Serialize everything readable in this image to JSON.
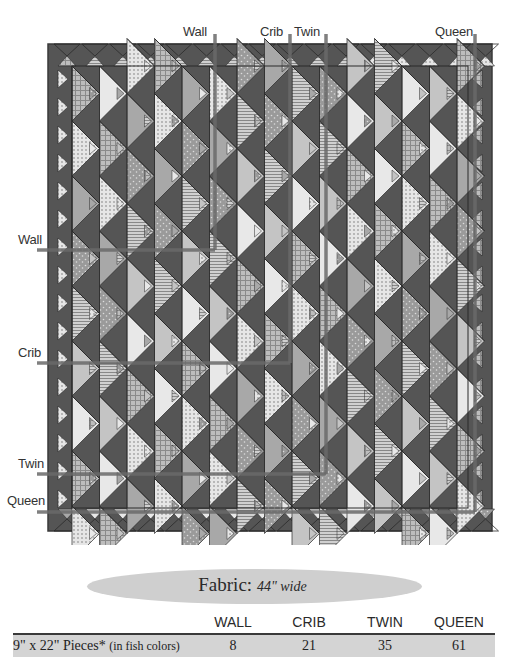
{
  "diagram": {
    "top_labels": [
      {
        "text": "Wall",
        "x": 215
      },
      {
        "text": "Crib",
        "x": 290
      },
      {
        "text": "Twin",
        "x": 326
      },
      {
        "text": "Queen",
        "x": 475
      }
    ],
    "left_labels": [
      {
        "text": "Wall",
        "y": 250
      },
      {
        "text": "Crib",
        "y": 363
      },
      {
        "text": "Twin",
        "y": 474
      },
      {
        "text": "Queen",
        "y": 512
      }
    ],
    "colors": {
      "quilt_dark": "#555555",
      "border": "#3a3a3a",
      "line": "#6a6a6a",
      "fish_light": "#e8e8e8",
      "fish_mid": "#a8a8a8"
    }
  },
  "fabric": {
    "title": "Fabric:",
    "subtitle": "44\" wide",
    "columns": [
      "WALL",
      "CRIB",
      "TWIN",
      "QUEEN"
    ],
    "rows": [
      {
        "label": "9\" x 22\" Pieces*",
        "note": "(in fish colors)",
        "values": [
          "8",
          "21",
          "35",
          "61"
        ]
      }
    ]
  }
}
